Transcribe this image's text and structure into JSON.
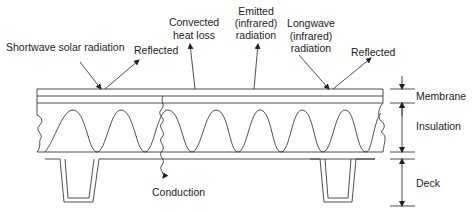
{
  "diagram": {
    "labels": {
      "shortwave": "Shortwave solar radiation",
      "reflected_left": "Reflected",
      "convected_1": "Convected",
      "convected_2": "heat loss",
      "emitted_1": "Emitted",
      "emitted_2": "(infrared)",
      "emitted_3": "radiation",
      "longwave_1": "Longwave",
      "longwave_2": "(infrared)",
      "longwave_3": "radiation",
      "reflected_right": "Reflected",
      "conduction": "Conduction"
    },
    "layers": {
      "membrane": "Membrane",
      "insulation": "Insulation",
      "deck": "Deck"
    },
    "colors": {
      "line": "#222222",
      "background": "#ffffff"
    }
  }
}
